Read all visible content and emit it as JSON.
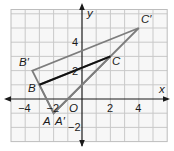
{
  "figure": {
    "type": "coordinate-plane-dilation",
    "colors": {
      "background": "#f7f7f7",
      "grid": "#c9c9c9",
      "grid_border": "#bdbdbd",
      "axis": "#1a1a1a",
      "image_triangle": "#7d7d7d",
      "preimage_segment": "#111111",
      "text": "#1a1a1a"
    },
    "axes": {
      "x_label": "x",
      "y_label": "y",
      "origin_label": "O",
      "x_range": [
        -5,
        6
      ],
      "y_range": [
        -3,
        6.3
      ],
      "x_ticks": [
        {
          "value": -4,
          "label": "−4"
        },
        {
          "value": -2,
          "label": "−2"
        },
        {
          "value": 2,
          "label": "2"
        },
        {
          "value": 4,
          "label": "4"
        }
      ],
      "y_ticks": [
        {
          "value": 4,
          "label": "4"
        },
        {
          "value": 2,
          "label": "2"
        },
        {
          "value": -2,
          "label": "−2"
        }
      ]
    },
    "points": {
      "A": {
        "label": "A",
        "x": -2,
        "y": -1
      },
      "B": {
        "label": "B",
        "x": -3,
        "y": 1
      },
      "C": {
        "label": "C",
        "x": 2,
        "y": 3
      },
      "A_prime": {
        "label": "A′",
        "x": -2,
        "y": -1
      },
      "B_prime": {
        "label": "B′",
        "x": -3.5,
        "y": 2
      },
      "C_prime": {
        "label": "C′",
        "x": 4,
        "y": 5
      }
    },
    "shapes": {
      "preimage_triangle": [
        "A",
        "B",
        "C"
      ],
      "image_triangle": [
        "A_prime",
        "B_prime",
        "C_prime"
      ],
      "emphasized_segment": [
        "B",
        "C"
      ]
    }
  }
}
